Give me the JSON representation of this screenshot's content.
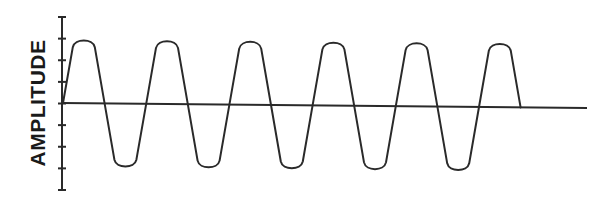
{
  "diagram": {
    "type": "waveform",
    "y_axis_label": "AMPLITUDE",
    "colors": {
      "stroke": "#2a2a2a",
      "label": "#1a1a1a",
      "background": "#ffffff"
    },
    "axis": {
      "x": 62,
      "top": 17,
      "bottom": 190,
      "tick_count": 9,
      "tick_half_length": 4
    },
    "baseline": {
      "x_start": 62,
      "y_start": 103,
      "x_end": 587,
      "y_end": 108
    },
    "wave": {
      "start_x": 63,
      "half_period": 41.6,
      "half_cycles": 11,
      "peak_y_start": 38,
      "peak_y_end": 42,
      "trough_y_start": 168,
      "trough_y_end": 173,
      "cycles_visible": 5.5
    }
  }
}
